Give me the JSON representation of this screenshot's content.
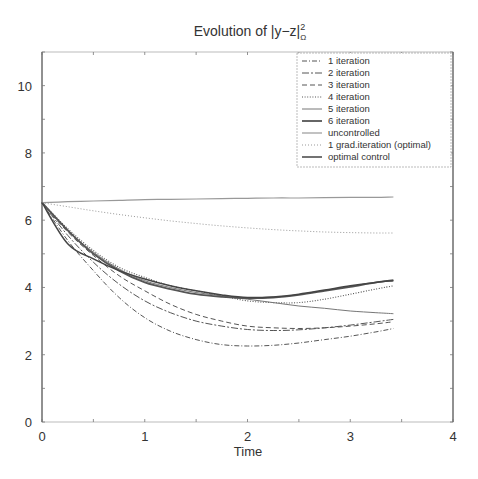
{
  "chart_data": {
    "type": "line",
    "title_parts": {
      "prefix": "Evolution of ",
      "expr": "|y−z|",
      "sup": "2",
      "sub": "Ω"
    },
    "xlabel": "Time",
    "ylabel": "",
    "xlim": [
      0,
      4
    ],
    "ylim": [
      0,
      11
    ],
    "xticks": [
      0,
      1,
      2,
      3,
      4
    ],
    "yticks": [
      0,
      2,
      4,
      6,
      8,
      10
    ],
    "grid": false,
    "legend_position": "upper right",
    "x": [
      0,
      0.25,
      0.5,
      0.75,
      1.0,
      1.25,
      1.5,
      1.75,
      2.0,
      2.25,
      2.5,
      2.75,
      3.0,
      3.25,
      3.42
    ],
    "series": [
      {
        "name": "1 iteration",
        "style": "dash-dot",
        "color": "#555555",
        "values": [
          6.52,
          5.4,
          4.5,
          3.7,
          3.1,
          2.7,
          2.45,
          2.3,
          2.26,
          2.28,
          2.35,
          2.45,
          2.55,
          2.68,
          2.78
        ]
      },
      {
        "name": "2 iteration",
        "style": "dash-dot-long",
        "color": "#555555",
        "values": [
          6.52,
          5.55,
          4.75,
          4.1,
          3.6,
          3.25,
          3.0,
          2.85,
          2.75,
          2.72,
          2.74,
          2.8,
          2.88,
          2.98,
          3.05
        ]
      },
      {
        "name": "3 iteration",
        "style": "dashed",
        "color": "#555555",
        "values": [
          6.52,
          5.65,
          4.95,
          4.35,
          3.9,
          3.5,
          3.2,
          3.0,
          2.85,
          2.8,
          2.78,
          2.8,
          2.85,
          2.92,
          2.98
        ]
      },
      {
        "name": "4 iteration",
        "style": "dotted",
        "color": "#555555",
        "values": [
          6.52,
          5.75,
          5.1,
          4.6,
          4.3,
          4.05,
          3.9,
          3.75,
          3.6,
          3.55,
          3.55,
          3.65,
          3.8,
          3.95,
          4.05
        ]
      },
      {
        "name": "5 iteration",
        "style": "solid-thin",
        "color": "#777777",
        "values": [
          6.52,
          5.7,
          5.05,
          4.55,
          4.2,
          4.0,
          3.85,
          3.75,
          3.65,
          3.55,
          3.45,
          3.38,
          3.3,
          3.25,
          3.22
        ]
      },
      {
        "name": "6 iteration",
        "style": "solid-thick",
        "color": "#555555",
        "values": [
          6.52,
          5.7,
          5.0,
          4.5,
          4.15,
          3.95,
          3.8,
          3.72,
          3.68,
          3.7,
          3.78,
          3.9,
          4.02,
          4.15,
          4.22
        ]
      },
      {
        "name": "uncontrolled",
        "style": "solid-light",
        "color": "#999999",
        "values": [
          6.52,
          6.55,
          6.57,
          6.59,
          6.61,
          6.62,
          6.63,
          6.64,
          6.65,
          6.66,
          6.66,
          6.67,
          6.68,
          6.68,
          6.69
        ]
      },
      {
        "name": "1 grad.iteration (optimal)",
        "style": "dotted-light",
        "color": "#999999",
        "values": [
          6.52,
          6.4,
          6.28,
          6.17,
          6.07,
          5.98,
          5.9,
          5.83,
          5.77,
          5.72,
          5.68,
          5.65,
          5.63,
          5.62,
          5.62
        ]
      },
      {
        "name": "optimal control",
        "style": "solid-marked",
        "color": "#444444",
        "values": [
          6.52,
          5.3,
          4.85,
          4.5,
          4.25,
          4.05,
          3.9,
          3.78,
          3.7,
          3.72,
          3.8,
          3.92,
          4.05,
          4.15,
          4.2
        ]
      }
    ]
  },
  "legend": {
    "items": [
      "1 iteration",
      "2 iteration",
      "3 iteration",
      "4 iteration",
      "5 iteration",
      "6 iteration",
      "uncontrolled",
      "1 grad.iteration (optimal)",
      "optimal control"
    ]
  },
  "axes": {
    "x_ticks_labels": [
      "0",
      "1",
      "2",
      "3",
      "4"
    ],
    "y_ticks_labels": [
      "0",
      "2",
      "4",
      "6",
      "8",
      "10"
    ]
  }
}
